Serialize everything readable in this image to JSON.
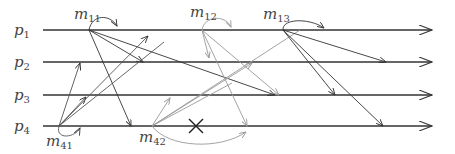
{
  "diagram": {
    "processes": [
      {
        "label": "p",
        "sub": "1",
        "y": 30
      },
      {
        "label": "p",
        "sub": "2",
        "y": 62
      },
      {
        "label": "p",
        "sub": "3",
        "y": 95
      },
      {
        "label": "p",
        "sub": "4",
        "y": 126
      }
    ],
    "events": [
      {
        "id": "m11",
        "label": "m",
        "sub": "11",
        "x": 89,
        "y": 30,
        "lx": 74,
        "ly": 19
      },
      {
        "id": "m12",
        "label": "m",
        "sub": "12",
        "x": 202,
        "y": 30,
        "lx": 190,
        "ly": 17
      },
      {
        "id": "m13",
        "label": "m",
        "sub": "13",
        "x": 283,
        "y": 30,
        "lx": 263,
        "ly": 19
      },
      {
        "id": "m41",
        "label": "m",
        "sub": "41",
        "x": 59,
        "y": 126,
        "lx": 46,
        "ly": 146
      },
      {
        "id": "m42",
        "label": "m",
        "sub": "42",
        "x": 152,
        "y": 126,
        "lx": 139,
        "ly": 142
      }
    ],
    "dropped_marker": {
      "symbol": "✕",
      "x": 196,
      "y": 126
    },
    "colors": {
      "dark": "#333333",
      "light": "#999999"
    }
  }
}
